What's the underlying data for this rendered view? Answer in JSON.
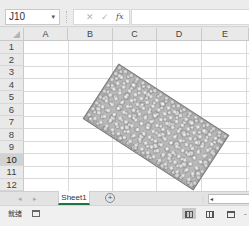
{
  "formula_bar": {
    "name_box": "J10",
    "name_box_caret": "▾",
    "cancel_icon": "✕",
    "enter_icon": "✓",
    "fx_label": "fx",
    "formula_value": ""
  },
  "grid": {
    "columns": [
      "A",
      "B",
      "C",
      "D",
      "E"
    ],
    "rows": [
      "1",
      "2",
      "3",
      "4",
      "5",
      "6",
      "7",
      "8",
      "9",
      "10",
      "11",
      "12",
      "13"
    ],
    "selected_cell": "J10",
    "selected_row": "10"
  },
  "shape": {
    "type": "rectangle",
    "fill": "water-droplets-texture",
    "rotation_deg": 33,
    "fill_color": "#b9b9b9",
    "border_color": "#7a7a7a"
  },
  "sheet_tabs": {
    "nav_prev": "◂",
    "nav_next": "▸",
    "tabs": [
      {
        "label": "Sheet1",
        "active": true
      }
    ],
    "add_sheet": "+",
    "scroll_left": "◂",
    "split_handle": "⋮"
  },
  "status_bar": {
    "status": "就绪",
    "view_normal_active": true,
    "zoom_minus": "-"
  },
  "colors": {
    "accent": "#217346",
    "header_bg": "#e9e9e9",
    "selected_header_bg": "#d2d2d2",
    "gridline": "#dadada"
  }
}
